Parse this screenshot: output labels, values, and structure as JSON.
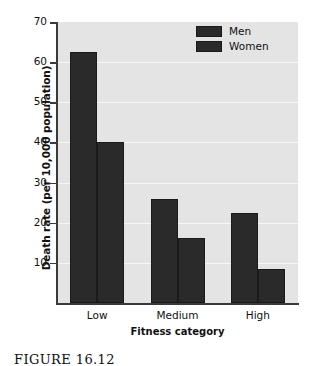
{
  "chart_data": {
    "type": "bar",
    "title": "",
    "xlabel": "Fitness category",
    "ylabel": "Death rate (per 10,000 population)",
    "categories": [
      "Low",
      "Medium",
      "High"
    ],
    "series": [
      {
        "name": "Men",
        "values": [
          62.5,
          26.0,
          22.3
        ]
      },
      {
        "name": "Women",
        "values": [
          40.0,
          16.3,
          8.5
        ]
      }
    ],
    "ylim": [
      0,
      70
    ],
    "yticks": [
      10,
      20,
      30,
      40,
      50,
      60,
      70
    ],
    "ytick_labels": [
      "10",
      "20",
      "30",
      "40",
      "50",
      "60",
      "70"
    ],
    "grid": true,
    "legend_position": "top-right",
    "bar_color": "#2a2a2a",
    "plot_background": "#e4e4e4",
    "gridline_color": "#f7f7f7"
  },
  "legend": {
    "items": [
      {
        "label": "Men"
      },
      {
        "label": "Women"
      }
    ]
  },
  "caption": {
    "text": "FIGURE  16.12"
  }
}
